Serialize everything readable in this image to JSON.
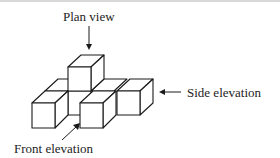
{
  "diagram": {
    "type": "isometric-projection",
    "labels": {
      "plan_view": "Plan view",
      "side_elevation": "Side elevation",
      "front_elevation": "Front elevation"
    },
    "colors": {
      "stroke": "#1a1a1a",
      "fill": "#ffffff",
      "text": "#222222"
    }
  }
}
